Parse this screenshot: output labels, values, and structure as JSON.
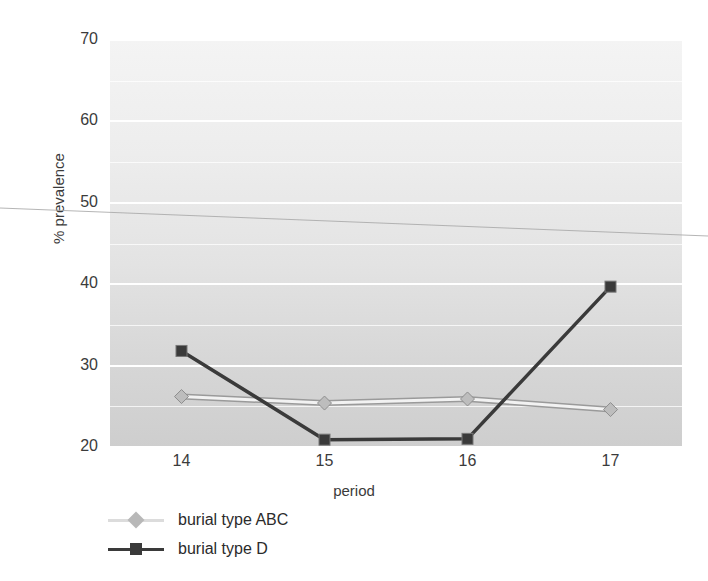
{
  "chart_data": {
    "type": "line",
    "title": "",
    "xlabel": "period",
    "ylabel": "% prevalence",
    "categories": [
      "14",
      "15",
      "16",
      "17"
    ],
    "x": [
      14,
      15,
      16,
      17
    ],
    "xlim": [
      13.5,
      17.5
    ],
    "ylim": [
      20,
      70
    ],
    "yticks": [
      20,
      30,
      40,
      50,
      60,
      70
    ],
    "ytick_labels": [
      "20",
      "30",
      "40",
      "50",
      "60",
      "70"
    ],
    "grid": true,
    "grid_axis": "y",
    "grid_color": "#ffffff",
    "legend_position": "below-left",
    "plot_background": "#e6e6e6",
    "series": [
      {
        "name": "burial type ABC",
        "values": [
          26.2,
          25.4,
          25.9,
          24.6
        ],
        "color": "#e8e8e8",
        "line_color": "#f2f2f2",
        "marker": "diamond",
        "marker_color": "#bdbdbd"
      },
      {
        "name": "burial type D",
        "values": [
          31.8,
          20.9,
          21.0,
          39.7
        ],
        "color": "#3a3a3a",
        "line_color": "#3a3a3a",
        "marker": "square",
        "marker_color": "#3a3a3a"
      }
    ]
  },
  "axes": {
    "y_title": "% prevalence",
    "x_title": "period",
    "y_ticks": [
      "70",
      "60",
      "50",
      "40",
      "30",
      "20"
    ],
    "x_ticks": [
      "14",
      "15",
      "16",
      "17"
    ]
  },
  "legend": {
    "items": [
      {
        "label": "burial type ABC",
        "marker": "diamond-marker"
      },
      {
        "label": "burial type D",
        "marker": "square-marker"
      }
    ]
  }
}
